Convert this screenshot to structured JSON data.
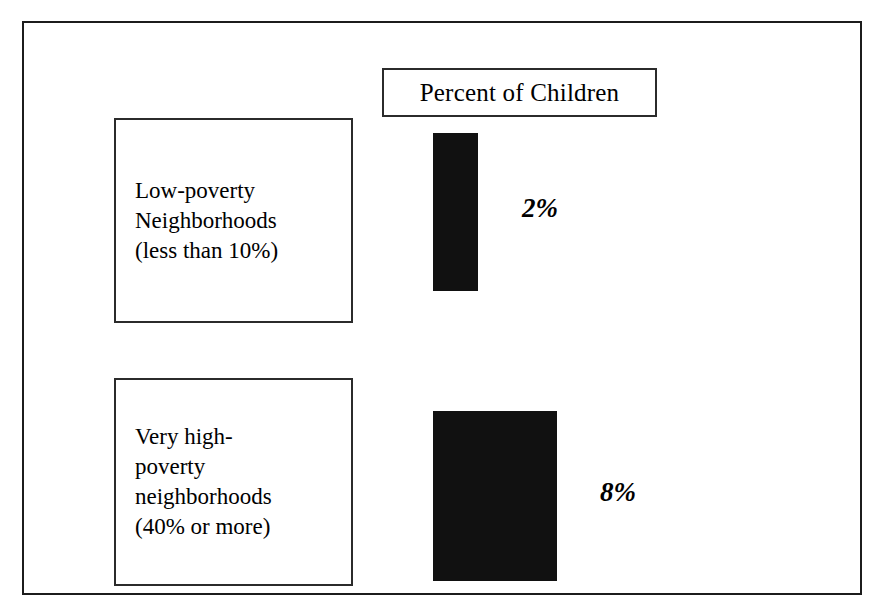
{
  "chart_data": {
    "type": "bar",
    "title": "Percent of Children",
    "orientation": "vertical",
    "xlabel": "",
    "ylabel": "",
    "categories": [
      "Low-poverty Neighborhoods (less than 10%)",
      "Very high-poverty neighborhoods (40% or more)"
    ],
    "values": [
      2,
      8
    ],
    "value_labels": [
      "2%",
      "8%"
    ],
    "unit": "%",
    "grid": false,
    "legend": "none",
    "series": [
      {
        "name": "Percent of Children",
        "values": [
          2,
          8
        ]
      }
    ]
  },
  "figure": {
    "title_box": {
      "text": "Percent of Children"
    },
    "categories": [
      {
        "id": "low-poverty",
        "lines": [
          "Low-poverty",
          "Neighborhoods",
          "(less than 10%)"
        ],
        "value_label": "2%"
      },
      {
        "id": "very-high-poverty",
        "lines": [
          "Very high-",
          "poverty",
          "neighborhoods",
          "(40% or more)"
        ],
        "value_label": "8%"
      }
    ],
    "colors": {
      "bar_fill": "#111111",
      "border": "#2b2b2b",
      "frame": "#1c1c1c",
      "background": "#ffffff",
      "text": "#000000"
    }
  }
}
